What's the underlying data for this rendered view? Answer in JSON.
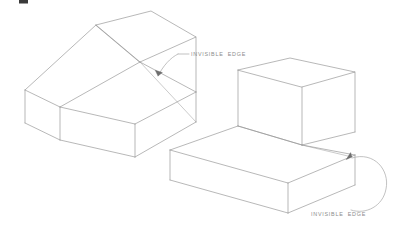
{
  "page": {
    "background_color": "#ffffff",
    "width": 402,
    "height": 247
  },
  "style": {
    "line_color": "#9a9a9a",
    "hidden_line_color": "#b5b5b5",
    "leader_color": "#a8a8a8",
    "arrow_color": "#6e6e6e",
    "text_color": "#8c8c8c"
  },
  "figures": [
    {
      "id": "left-wedge",
      "name": "wedge-solid",
      "description": "Isometric wedge block with sloped chamfer face",
      "callout": {
        "label": "INVISIBLE  EDGE",
        "text_x": 191,
        "text_y": 56,
        "leader_tick_x1": 178,
        "leader_tick_y1": 54,
        "leader_tick_x2": 188,
        "leader_tick_y2": 54,
        "leader_path": "M 178,54 C 170,58 163,66 158,76",
        "arrow_points": "158,76 155.2,70.6 162.2,72.4"
      },
      "top_face": "M 96,25 L 151,11 L 196,37 L 140,62 Z",
      "left_face": "M 96,25 L 140,62 L 60,107 L 25,90 Z",
      "right_face": "M 196,37 L 196,92 L 140,62 Z",
      "slope_face": "M 140,62 L 196,92 L 135,124 L 60,107 Z",
      "front_face": "M 25,90 L 60,107 L 60,140 L 25,123 Z",
      "bottom_right_face": "M 60,107 L 135,124 L 135,157 L 60,140 Z",
      "hidden_edge_path": "M 140,62 L 196,122"
    },
    {
      "id": "right-step-block",
      "name": "stepped-block-solid",
      "description": "Isometric L-shaped stepped block",
      "callout": {
        "label": "INVISIBLE  EDGE",
        "text_x": 311,
        "text_y": 216,
        "leader_path": "M 352,157 C 372,152 386,170 384,188 C 382,204 366,214 352,210",
        "arrow_points": "352,157 346.5,159.8 349.8,153.2"
      },
      "upper_top_face": "M 238,70 L 290,58 L 355,72 L 302,87 Z",
      "upper_left_face": "M 238,70 L 302,87 L 302,145 L 238,126 Z",
      "upper_right_face": "M 302,87 L 355,72 L 355,132 L 302,145 Z",
      "lower_top_face": "M 170,150 L 238,126 L 355,155 L 288,183 Z",
      "lower_left_face": "M 170,150 L 288,183 L 288,213 L 170,180 Z",
      "lower_right_face": "M 288,183 L 355,155 L 355,185 L 288,213 Z",
      "hidden_edge_path": "M 302,145 L 352,157"
    }
  ],
  "artifacts": {
    "cropped_fragment_note": "partial dark glyph clipped at top edge",
    "fragment_x": 19,
    "fragment_y": 0,
    "fragment_w": 9,
    "fragment_h": 4
  }
}
